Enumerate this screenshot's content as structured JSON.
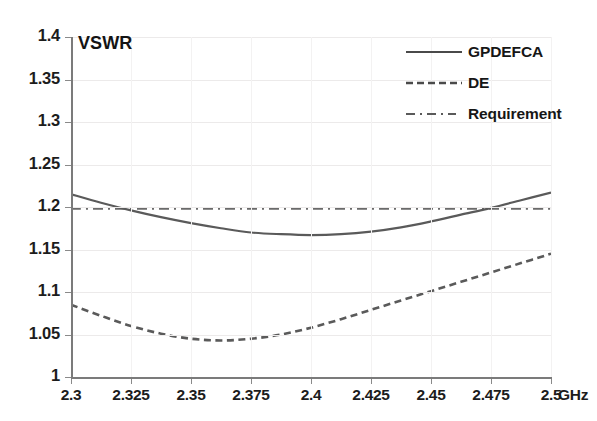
{
  "chart_data": {
    "type": "line",
    "title": "",
    "ylabel": "VSWR",
    "xlabel": "GHz",
    "x_unit": "GHz",
    "xlim": [
      2.3,
      2.5
    ],
    "ylim": [
      1.0,
      1.4
    ],
    "grid": true,
    "legend_position": "top-right",
    "x_tick_labels": [
      "2.3",
      "2.325",
      "2.35",
      "2.375",
      "2.4",
      "2.425",
      "2.45",
      "2.475",
      "2.5"
    ],
    "x_ticks": [
      2.3,
      2.325,
      2.35,
      2.375,
      2.4,
      2.425,
      2.45,
      2.475,
      2.5
    ],
    "y_tick_labels": [
      "1.4",
      "1.35",
      "1.3",
      "1.25",
      "1.2",
      "1.15",
      "1.1",
      "1.05",
      "1"
    ],
    "y_ticks": [
      1.4,
      1.35,
      1.3,
      1.25,
      1.2,
      1.15,
      1.1,
      1.05,
      1.0
    ],
    "x": [
      2.3,
      2.3125,
      2.325,
      2.3375,
      2.35,
      2.3625,
      2.375,
      2.3875,
      2.4,
      2.4125,
      2.425,
      2.4375,
      2.45,
      2.4625,
      2.475,
      2.4875,
      2.5
    ],
    "series": [
      {
        "name": "GPDEFCA",
        "style": "solid",
        "color": "#5a5a5a",
        "values": [
          1.215,
          1.205,
          1.196,
          1.188,
          1.181,
          1.175,
          1.17,
          1.168,
          1.167,
          1.168,
          1.171,
          1.176,
          1.183,
          1.191,
          1.199,
          1.208,
          1.217
        ]
      },
      {
        "name": "DE",
        "style": "dashed",
        "color": "#5a5a5a",
        "values": [
          1.085,
          1.072,
          1.06,
          1.051,
          1.045,
          1.043,
          1.045,
          1.05,
          1.058,
          1.068,
          1.079,
          1.09,
          1.101,
          1.112,
          1.123,
          1.134,
          1.145
        ]
      },
      {
        "name": "Requirement",
        "style": "dash-dot",
        "color": "#6a6a6a",
        "values": [
          1.198,
          1.198,
          1.198,
          1.198,
          1.198,
          1.198,
          1.198,
          1.198,
          1.198,
          1.198,
          1.198,
          1.198,
          1.198,
          1.198,
          1.198,
          1.198,
          1.198
        ]
      }
    ]
  },
  "legend": {
    "items": [
      {
        "label": "GPDEFCA",
        "style": "solid"
      },
      {
        "label": "DE",
        "style": "dashed"
      },
      {
        "label": "Requirement",
        "style": "dash-dot"
      }
    ]
  },
  "axis_titles": {
    "y": "VSWR",
    "x_unit": "GHz"
  }
}
